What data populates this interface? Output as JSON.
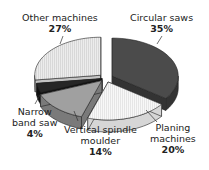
{
  "chart_data": {
    "type": "pie",
    "style": "3d-exploded",
    "title": "",
    "categories": [
      "Circular saws",
      "Planing machines",
      "Vertical spindle moulder",
      "Narrow band saw",
      "Other machines"
    ],
    "values": [
      35,
      20,
      14,
      4,
      27
    ],
    "unit": "%",
    "colors": [
      "#4a4a4a",
      "#f4f4f4",
      "#9a9a9a",
      "#222222",
      "#e4e4e4"
    ],
    "legend": "none (callout labels)"
  },
  "labels": {
    "circular": {
      "name": "Circular saws",
      "pct": "35%"
    },
    "planing": {
      "name1": "Planing",
      "name2": "machines",
      "pct": "20%"
    },
    "spindle": {
      "name1": "Vertical spindle",
      "name2": "moulder",
      "pct": "14%"
    },
    "narrow": {
      "name1": "Narrow",
      "name2": "band saw",
      "pct": "4%"
    },
    "other": {
      "name": "Other machines",
      "pct": "27%"
    }
  }
}
